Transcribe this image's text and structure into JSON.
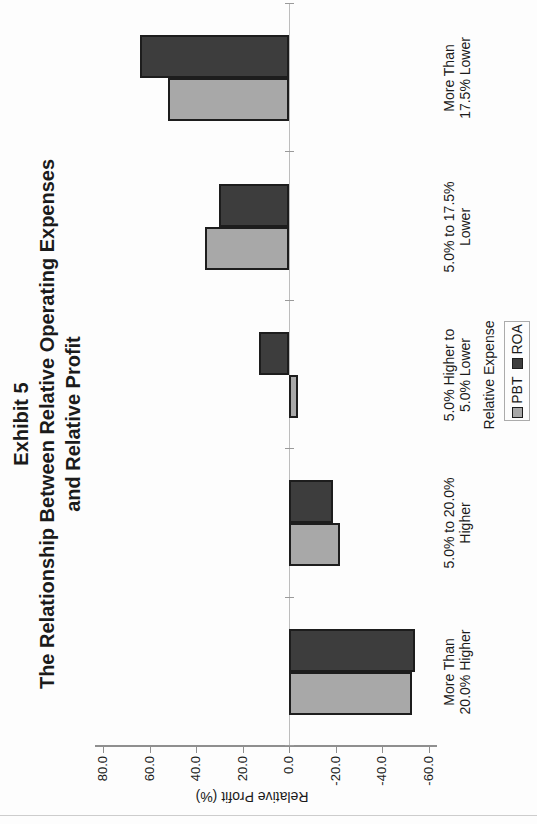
{
  "page": {
    "background": "#fdfdfd"
  },
  "chart_data": {
    "type": "bar",
    "orientation": "column chart rotated 90 degrees counterclockwise on the page",
    "title_lines": [
      "Exhibit 5",
      "The Relationship Between Relative Operating Expenses",
      "and Relative Profit"
    ],
    "categories": [
      [
        "More Than",
        "20.0% Higher"
      ],
      [
        "5.0% to 20.0%",
        "Higher"
      ],
      [
        "5.0% Higher to",
        "5.0% Lower"
      ],
      [
        "5.0% to 17.5%",
        "Lower"
      ],
      [
        "More Than",
        "17.5% Lower"
      ]
    ],
    "series": [
      {
        "name": "PBT",
        "color": "#a8a8a8",
        "values": [
          -53,
          -22,
          -4,
          36,
          52
        ]
      },
      {
        "name": "ROA",
        "color": "#3d3d3d",
        "values": [
          -54,
          -19,
          13,
          30,
          64
        ]
      }
    ],
    "xlabel": "Relative Expense",
    "ylabel": "Relative Profit (%)",
    "ylim": [
      -60,
      80
    ],
    "ytick_step": 20,
    "ytick_labels": [
      "80.0",
      "60.0",
      "40.0",
      "20.0",
      "0.0",
      "-20.0",
      "-40.0",
      "-60.0"
    ],
    "ytick_values": [
      80,
      60,
      40,
      20,
      0,
      -20,
      -40,
      -60
    ],
    "grid": false,
    "legend_position": "bottom-center",
    "bar_border_color": "#1d1d1d",
    "axis_color": "#8f8f8f"
  }
}
